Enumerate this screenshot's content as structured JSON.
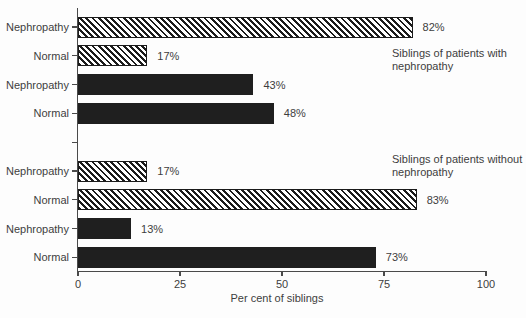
{
  "chart_data": {
    "type": "bar",
    "orientation": "horizontal",
    "title": "",
    "xlabel": "Per cent of siblings",
    "ylabel": "",
    "xlim": [
      0,
      100
    ],
    "xticks": [
      "0",
      "25",
      "50",
      "75",
      "100"
    ],
    "xtick_values": [
      0,
      25,
      50,
      75,
      100
    ],
    "grid": false,
    "legend": "none",
    "groups": [
      {
        "annotation_lines": [
          "Siblings of patients with",
          "nephropathy"
        ],
        "bars": [
          {
            "category": "Nephropathy",
            "value": 82,
            "value_label": "82%",
            "style": "hatched"
          },
          {
            "category": "Normal",
            "value": 17,
            "value_label": "17%",
            "style": "hatched"
          },
          {
            "category": "Nephropathy",
            "value": 43,
            "value_label": "43%",
            "style": "solid"
          },
          {
            "category": "Normal",
            "value": 48,
            "value_label": "48%",
            "style": "solid"
          }
        ]
      },
      {
        "annotation_lines": [
          "Siblings of patients without",
          "nephropathy"
        ],
        "bars": [
          {
            "category": "Nephropathy",
            "value": 17,
            "value_label": "17%",
            "style": "hatched"
          },
          {
            "category": "Normal",
            "value": 83,
            "value_label": "83%",
            "style": "hatched"
          },
          {
            "category": "Nephropathy",
            "value": 13,
            "value_label": "13%",
            "style": "solid"
          },
          {
            "category": "Normal",
            "value": 73,
            "value_label": "73%",
            "style": "solid"
          }
        ]
      }
    ],
    "colors": {
      "solid_bar": "#1f1f1f",
      "hatch_stripe": "#1b1b1b",
      "hatch_background": "#ffffff",
      "text": "#3d3d3d",
      "axis": "#4a4a4a",
      "background": "#fdfdfd"
    }
  }
}
